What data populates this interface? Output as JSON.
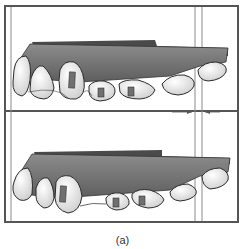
{
  "figure": {
    "caption": "(a)",
    "panels": [
      {
        "name": "top-model",
        "description": "dental arch model with brackets, with gap indicator arrows"
      },
      {
        "name": "bottom-model",
        "description": "dental arch model with brackets"
      }
    ],
    "colors": {
      "frame": "#555555",
      "guide_lines": "#8a8a8a",
      "gum_base": "#6e6e6e",
      "tooth": "#ececec",
      "tooth_outline": "#2a2a2a",
      "bracket": "#707070",
      "arrow": "#555555"
    }
  }
}
